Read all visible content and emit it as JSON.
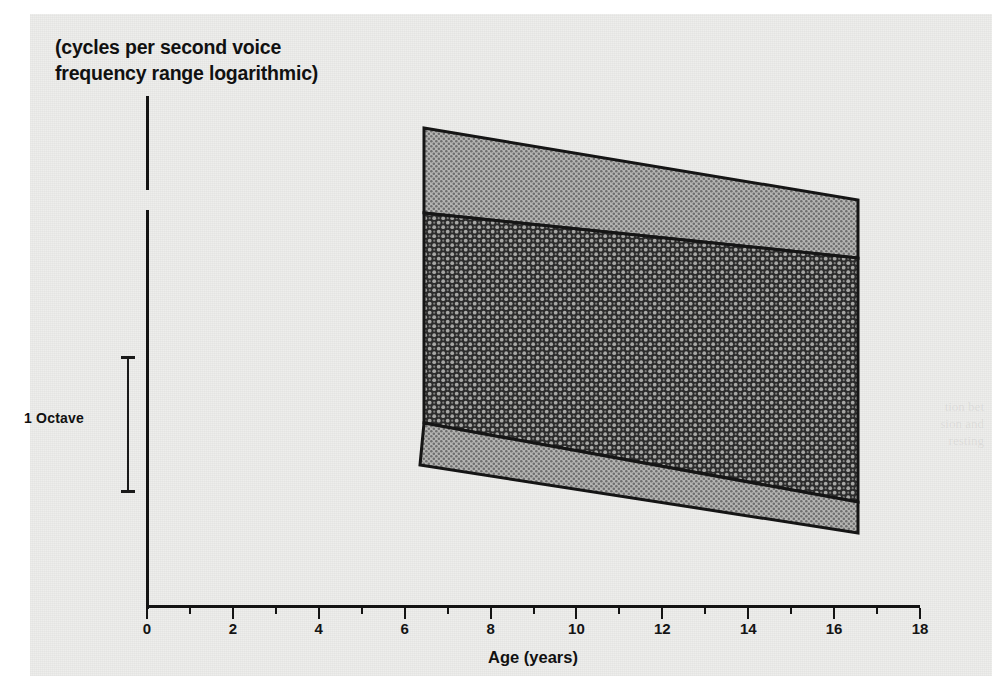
{
  "figure": {
    "background_color": "#eeeeec",
    "ink_color": "#141414"
  },
  "chart_data": {
    "type": "area",
    "title": "(cycles per second voice\nfrequency range logarithmic)",
    "xlabel": "Age (years)",
    "ylabel": "(cycles per second voice frequency range logarithmic)",
    "xlim": [
      0,
      18
    ],
    "ylim_label": "1 Octave",
    "grid": false,
    "legend": false,
    "x_ticks_major": [
      0,
      2,
      4,
      6,
      8,
      10,
      12,
      14,
      16,
      18
    ],
    "x_ticks_minor": [
      1,
      3,
      5,
      7,
      9,
      11,
      13,
      15,
      17
    ],
    "x_tick_labels": [
      "0",
      "2",
      "4",
      "6",
      "8",
      "10",
      "12",
      "14",
      "16",
      "18"
    ],
    "y_scale_bar": {
      "label": "1 Octave",
      "span_octaves": 1
    },
    "x_data_range": [
      6,
      16
    ],
    "series": [
      {
        "name": "upper-light-band",
        "fill": "light-halftone",
        "fill_color": "#9a9a9a",
        "upper_values": [
          1.0,
          0.955
        ],
        "lower_values": [
          0.78,
          0.73
        ]
      },
      {
        "name": "central-dark-band",
        "fill": "dark-crosshatch",
        "fill_color": "#3a3a3a",
        "upper_values": [
          0.78,
          0.73
        ],
        "lower_values": [
          0.195,
          0.145
        ]
      },
      {
        "name": "lower-light-band",
        "fill": "light-halftone",
        "fill_color": "#9a9a9a",
        "upper_values": [
          0.195,
          0.145
        ],
        "lower_values": [
          0.0,
          -0.06
        ]
      }
    ]
  },
  "axis_titles": {
    "y_line1": "(cycles per second voice",
    "y_line2": "frequency range logarithmic)",
    "x": "Age (years)"
  },
  "ghost_showthrough": {
    "right": "tion bet\nsion and\nresting",
    "middle": "of vocal"
  }
}
